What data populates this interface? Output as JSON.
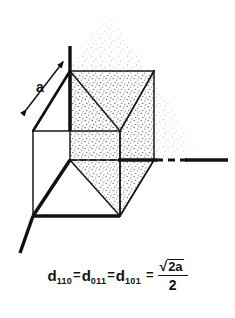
{
  "figure": {
    "type": "crystallography-unit-cell-diagram",
    "edge_label": "a",
    "colors": {
      "ink": "#111111",
      "line": "#1a1a1a",
      "stipple": "#8a8a8a",
      "background": "#ffffff"
    },
    "caption": {
      "terms": [
        {
          "base": "d",
          "sub": "110"
        },
        {
          "base": "d",
          "sub": "011"
        },
        {
          "base": "d",
          "sub": "101"
        }
      ],
      "equals": "=",
      "equals_final": "=",
      "fraction": {
        "radical_sign": "√",
        "radicand": "2a",
        "denominator": "2"
      },
      "plain_text": "d110 = d011 = d101 = √2a / 2"
    },
    "geometry": {
      "cube": {
        "front_top_left": [
          33,
          131
        ],
        "front_top_right": [
          120,
          131
        ],
        "front_bottom_left": [
          33,
          216
        ],
        "front_bottom_right": [
          120,
          216
        ],
        "back_top_left": [
          70,
          71
        ],
        "back_top_right": [
          154,
          71
        ],
        "back_bottom_left": [
          70,
          160
        ],
        "back_bottom_right": [
          154,
          160
        ]
      },
      "axes": {
        "vertical_top": [
          70,
          46
        ],
        "horizontal_right": [
          228,
          160
        ],
        "diagonal_front": [
          20,
          253
        ]
      },
      "plane_apex": [
        105,
        8
      ],
      "plane_right_extent": 207
    }
  }
}
